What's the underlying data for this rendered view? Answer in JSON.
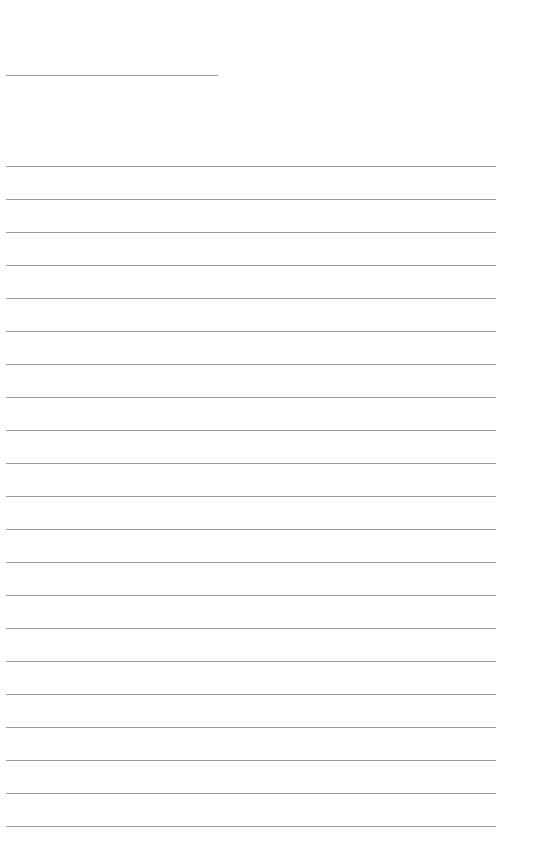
{
  "page": {
    "type": "lined-writing-paper",
    "background": "#ffffff",
    "line_color": "#9a9a9a",
    "title_line": {
      "top": 75,
      "left": 6,
      "width": 212
    },
    "ruled_lines": {
      "count": 21,
      "first_top": 166,
      "spacing": 33,
      "left": 6,
      "width": 490
    }
  }
}
